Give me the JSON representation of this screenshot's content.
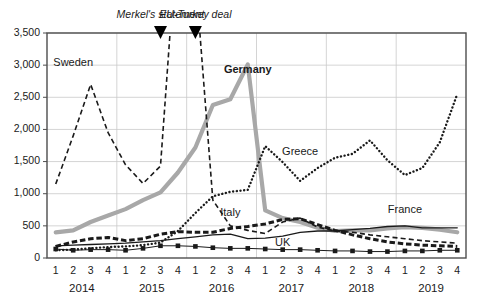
{
  "chart_data": {
    "type": "line",
    "title": "",
    "xlabel": "",
    "ylabel": "",
    "ylim": [
      0,
      3500
    ],
    "ytick_step": 500,
    "yticks": [
      0,
      500,
      1000,
      1500,
      2000,
      2500,
      3000,
      3500
    ],
    "ytick_labels": [
      "0",
      "500",
      "1,000",
      "1,500",
      "2,000",
      "2,500",
      "3,000",
      "3,500"
    ],
    "grid": "horizontal-and-year-separators",
    "legend": "inline-labels",
    "x": [
      "2014 Q1",
      "2014 Q2",
      "2014 Q3",
      "2014 Q4",
      "2015 Q1",
      "2015 Q2",
      "2015 Q3",
      "2015 Q4",
      "2016 Q1",
      "2016 Q2",
      "2016 Q3",
      "2016 Q4",
      "2017 Q1",
      "2017 Q2",
      "2017 Q3",
      "2017 Q4",
      "2018 Q1",
      "2018 Q2",
      "2018 Q3",
      "2018 Q4",
      "2019 Q1",
      "2019 Q2",
      "2019 Q3",
      "2019 Q4"
    ],
    "quarter_tick_labels": [
      "1",
      "2",
      "3",
      "4",
      "1",
      "2",
      "3",
      "4",
      "1",
      "2",
      "3",
      "4",
      "1",
      "2",
      "3",
      "4",
      "1",
      "2",
      "3",
      "4",
      "1",
      "2",
      "3",
      "4"
    ],
    "year_group_labels": [
      "2014",
      "2015",
      "2016",
      "2017",
      "2018",
      "2019"
    ],
    "categories": [
      "2014 Q1",
      "2014 Q2",
      "2014 Q3",
      "2014 Q4",
      "2015 Q1",
      "2015 Q2",
      "2015 Q3",
      "2015 Q4",
      "2016 Q1",
      "2016 Q2",
      "2016 Q3",
      "2016 Q4",
      "2017 Q1",
      "2017 Q2",
      "2017 Q3",
      "2017 Q4",
      "2018 Q1",
      "2018 Q2",
      "2018 Q3",
      "2018 Q4",
      "2019 Q1",
      "2019 Q2",
      "2019 Q3",
      "2019 Q4"
    ],
    "series": [
      {
        "name": "Sweden",
        "style": "dashed",
        "color": "#1a1a1a",
        "label_position": {
          "x": "2014 Q2",
          "y": 2980
        },
        "clipped_above_axis_max": true,
        "values": [
          1150,
          1900,
          2700,
          1950,
          1450,
          1160,
          1430,
          5200,
          4400,
          900,
          500,
          430,
          380,
          560,
          620,
          480,
          420,
          400,
          360,
          330,
          300,
          270,
          250,
          230
        ]
      },
      {
        "name": "Germany",
        "style": "thick-grey",
        "color": "#a8a8a8",
        "label_position": {
          "x": "2016 Q4",
          "y": 2880
        },
        "values": [
          400,
          430,
          560,
          660,
          760,
          900,
          1020,
          1330,
          1720,
          2380,
          2470,
          3010,
          740,
          620,
          560,
          470,
          420,
          430,
          430,
          460,
          480,
          470,
          440,
          400
        ]
      },
      {
        "name": "Greece",
        "style": "dotted",
        "color": "#1a1a1a",
        "label_position": {
          "x": "2017 Q3",
          "y": 1600
        },
        "values": [
          120,
          130,
          150,
          170,
          180,
          200,
          240,
          420,
          700,
          960,
          1030,
          1060,
          1740,
          1490,
          1200,
          1400,
          1560,
          1620,
          1830,
          1520,
          1290,
          1400,
          1800,
          2550
        ]
      },
      {
        "name": "Italy",
        "style": "bold-dashed",
        "color": "#1a1a1a",
        "label_position": {
          "x": "2016 Q3",
          "y": 660
        },
        "values": [
          180,
          250,
          300,
          320,
          270,
          300,
          370,
          410,
          400,
          400,
          460,
          490,
          530,
          600,
          610,
          520,
          430,
          360,
          300,
          250,
          220,
          200,
          190,
          180
        ]
      },
      {
        "name": "France",
        "style": "thin-solid",
        "color": "#1a1a1a",
        "label_position": {
          "x": "2019 Q1",
          "y": 700
        },
        "values": [
          190,
          200,
          210,
          220,
          230,
          250,
          270,
          300,
          330,
          360,
          370,
          300,
          310,
          340,
          400,
          420,
          420,
          440,
          460,
          490,
          500,
          470,
          470,
          470
        ]
      },
      {
        "name": "UK",
        "style": "square-markers",
        "color": "#1a1a1a",
        "label_position": {
          "x": "2017 Q2",
          "y": 190
        },
        "values": [
          140,
          120,
          130,
          130,
          120,
          150,
          190,
          190,
          180,
          160,
          150,
          150,
          140,
          130,
          130,
          120,
          110,
          110,
          100,
          100,
          110,
          110,
          120,
          120
        ]
      }
    ],
    "annotations": [
      {
        "label": "Merkel's statement",
        "x": "2015 Q3",
        "marker": "down-triangle"
      },
      {
        "label": "EU-Turkey deal",
        "x": "2016 Q1",
        "marker": "down-triangle"
      }
    ]
  }
}
